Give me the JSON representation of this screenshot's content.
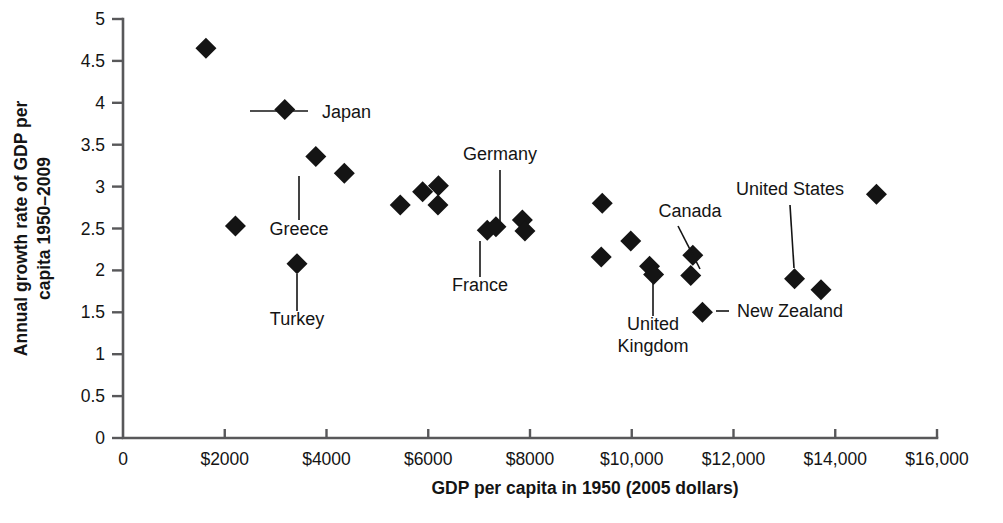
{
  "chart_data": {
    "type": "scatter",
    "title": "",
    "xlabel": "GDP per capita in 1950 (2005 dollars)",
    "ylabel_line1": "Annual growth rate of GDP per",
    "ylabel_line2": "capita 1950–2009",
    "xlim": [
      0,
      16000
    ],
    "ylim": [
      0,
      5
    ],
    "grid": false,
    "legend": "none",
    "xticks": [
      0,
      2000,
      4000,
      6000,
      8000,
      10000,
      12000,
      14000,
      16000
    ],
    "xtick_labels": [
      "0",
      "$2000",
      "$4000",
      "$6000",
      "$8000",
      "$10,000",
      "$12,000",
      "$14,000",
      "$16,000"
    ],
    "yticks": [
      0,
      0.5,
      1,
      1.5,
      2,
      2.5,
      3,
      3.5,
      4,
      4.5,
      5
    ],
    "ytick_labels": [
      "0",
      "0.5",
      "1",
      "1.5",
      "2",
      "2.5",
      "3",
      "3.5",
      "4",
      "4.5",
      "5"
    ],
    "marker_shape": "diamond",
    "marker_color": "#141414",
    "points": [
      {
        "x": 1630,
        "y": 4.65,
        "label": ""
      },
      {
        "x": 2210,
        "y": 2.53,
        "label": ""
      },
      {
        "x": 3180,
        "y": 3.92,
        "label": "Japan"
      },
      {
        "x": 3420,
        "y": 2.08,
        "label": "Turkey"
      },
      {
        "x": 3790,
        "y": 3.36,
        "label": ""
      },
      {
        "x": 4350,
        "y": 3.16,
        "label": "Greece"
      },
      {
        "x": 5450,
        "y": 2.78,
        "label": ""
      },
      {
        "x": 5890,
        "y": 2.94,
        "label": ""
      },
      {
        "x": 6200,
        "y": 3.01,
        "label": ""
      },
      {
        "x": 6190,
        "y": 2.78,
        "label": ""
      },
      {
        "x": 7160,
        "y": 2.48,
        "label": "France"
      },
      {
        "x": 7330,
        "y": 2.52,
        "label": "Germany"
      },
      {
        "x": 7850,
        "y": 2.6,
        "label": ""
      },
      {
        "x": 7900,
        "y": 2.47,
        "label": ""
      },
      {
        "x": 9420,
        "y": 2.8,
        "label": ""
      },
      {
        "x": 9400,
        "y": 2.16,
        "label": ""
      },
      {
        "x": 9980,
        "y": 2.35,
        "label": ""
      },
      {
        "x": 10350,
        "y": 2.05,
        "label": "United Kingdom"
      },
      {
        "x": 10430,
        "y": 1.95,
        "label": ""
      },
      {
        "x": 11200,
        "y": 2.18,
        "label": ""
      },
      {
        "x": 11160,
        "y": 1.94,
        "label": "Canada"
      },
      {
        "x": 11390,
        "y": 1.5,
        "label": "New Zealand"
      },
      {
        "x": 13200,
        "y": 1.9,
        "label": "United States"
      },
      {
        "x": 13720,
        "y": 1.77,
        "label": ""
      },
      {
        "x": 14810,
        "y": 2.91,
        "label": ""
      }
    ],
    "annotations": [
      {
        "name": "Japan",
        "text": "Japan",
        "label_x": 322,
        "label_y": 118,
        "anchor": "start",
        "line": [
          308,
          111,
          250,
          111
        ]
      },
      {
        "name": "Greece",
        "text": "Greece",
        "label_x": 299,
        "label_y": 235,
        "anchor": "middle",
        "line": [
          299,
          220,
          299,
          176
        ]
      },
      {
        "name": "Turkey",
        "text": "Turkey",
        "label_x": 297,
        "label_y": 325,
        "anchor": "middle",
        "line": [
          297,
          311,
          297,
          274
        ]
      },
      {
        "name": "Germany",
        "text": "Germany",
        "label_x": 500,
        "label_y": 160,
        "anchor": "middle",
        "line": [
          500,
          170,
          500,
          222
        ]
      },
      {
        "name": "France",
        "text": "France",
        "label_x": 480,
        "label_y": 291,
        "anchor": "middle",
        "line": [
          480,
          277,
          480,
          241
        ]
      },
      {
        "name": "Canada",
        "text": "Canada",
        "label_x": 690,
        "label_y": 217,
        "anchor": "middle",
        "line": [
          678,
          226,
          700,
          269
        ]
      },
      {
        "name": "United Kingdom",
        "text_line1": "United",
        "text_line2": "Kingdom",
        "label_x": 653,
        "label_y": 330,
        "label_y2": 352,
        "anchor": "middle",
        "line": [
          653,
          316,
          653,
          283
        ]
      },
      {
        "name": "New Zealand",
        "text": "New Zealand",
        "label_x": 737,
        "label_y": 317,
        "anchor": "start",
        "line": [
          729,
          311,
          716,
          311
        ]
      },
      {
        "name": "United States",
        "text": "United States",
        "label_x": 790,
        "label_y": 195,
        "anchor": "middle",
        "line": [
          790,
          205,
          794,
          268
        ]
      }
    ]
  },
  "geometry": {
    "plot_x0": 123,
    "plot_y0": 438,
    "plot_x1": 937,
    "plot_y1": 19,
    "tick_len_x": 9,
    "tick_len_y": 11,
    "marker_half": 10.5
  }
}
